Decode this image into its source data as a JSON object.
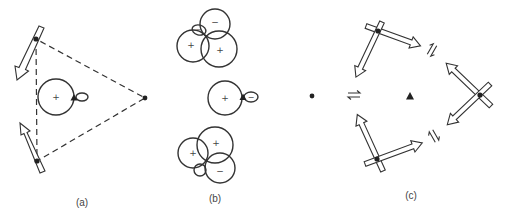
{
  "figure": {
    "panels": [
      {
        "id": "a",
        "label": "(a)",
        "vertices": [
          [
            36,
            39
          ],
          [
            37,
            161
          ],
          [
            145,
            98
          ]
        ],
        "center_circle": {
          "cx": 56,
          "cy": 97,
          "r": 18,
          "sign": "+"
        },
        "lobe": {
          "cx": 82,
          "cy": 97,
          "rx": 6,
          "ry": 4
        },
        "triangle_marker": [
          74,
          98
        ],
        "arrows": [
          {
            "from": [
              41,
              27
            ],
            "tip": [
              17,
              80
            ]
          },
          {
            "from": [
              42,
              172
            ],
            "tip": [
              20,
              123
            ]
          }
        ]
      },
      {
        "id": "b",
        "label": "(b)",
        "top_cluster": {
          "circles": [
            {
              "cx": 215,
              "cy": 24,
              "r": 15,
              "sign": "−"
            },
            {
              "cx": 193,
              "cy": 46,
              "r": 16,
              "sign": "+"
            },
            {
              "cx": 219,
              "cy": 49,
              "r": 18,
              "sign": "+"
            }
          ],
          "lobe": {
            "cx": 199,
            "cy": 30,
            "rx": 7,
            "ry": 5,
            "sign": "−"
          }
        },
        "middle": {
          "circle": {
            "cx": 225,
            "cy": 98,
            "r": 17,
            "sign": "+"
          },
          "triangle_marker": [
            243,
            97
          ],
          "lobe": {
            "cx": 251,
            "cy": 97,
            "rx": 7,
            "ry": 5,
            "sign": "−"
          }
        },
        "bottom_cluster": {
          "circles": [
            {
              "cx": 215,
              "cy": 145,
              "r": 18,
              "sign": "+"
            },
            {
              "cx": 193,
              "cy": 153,
              "r": 15,
              "sign": "+"
            },
            {
              "cx": 220,
              "cy": 168,
              "r": 15,
              "sign": "−"
            }
          ],
          "lobe": {
            "cx": 200,
            "cy": 170,
            "rx": 6,
            "ry": 6,
            "sign": ""
          }
        }
      },
      {
        "id": "c",
        "label": "(c)",
        "dot": [
          312,
          96
        ],
        "center_triangle": [
          410,
          96
        ],
        "equilibrium_symbols": [
          {
            "x": 354,
            "y": 95,
            "rotate": 0
          },
          {
            "x": 432,
            "y": 50,
            "rotate": -60
          },
          {
            "x": 434,
            "y": 136,
            "rotate": 60
          }
        ],
        "nodes": [
          {
            "at": [
              378,
              31
            ],
            "arrows": [
              {
                "from": [
                  366,
                  26
                ],
                "tip": [
                  421,
                  46
                ]
              },
              {
                "from": [
                  382,
                  22
                ],
                "tip": [
                  356,
                  77
                ]
              }
            ]
          },
          {
            "at": [
              480,
              95
            ],
            "arrows": [
              {
                "from": [
                  491,
                  106
                ],
                "tip": [
                  446,
                  63
                ]
              },
              {
                "from": [
                  490,
                  84
                ],
                "tip": [
                  447,
                  125
                ]
              }
            ]
          },
          {
            "at": [
              377,
              159
            ],
            "arrows": [
              {
                "from": [
                  383,
                  171
                ],
                "tip": [
                  357,
                  114
                ]
              },
              {
                "from": [
                  365,
                  164
                ],
                "tip": [
                  422,
                  143
                ]
              }
            ]
          }
        ]
      }
    ],
    "signs": {
      "plus": "+",
      "minus": "−"
    }
  },
  "labels": {
    "a": "(a)",
    "b": "(b)",
    "c": "(c)"
  },
  "colors": {
    "ink": "#333333",
    "background": "#ffffff"
  }
}
